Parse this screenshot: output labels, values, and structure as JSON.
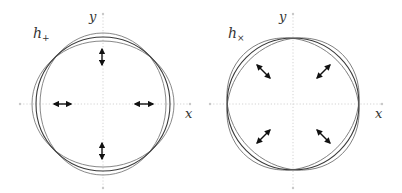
{
  "panels": [
    {
      "id": "plus",
      "polarization_label": "h",
      "polarization_subscript": "+",
      "x_axis_label": "x",
      "y_axis_label": "y",
      "deformation": "plus",
      "arrow_directions": [
        "vertical-top",
        "horizontal-left",
        "horizontal-right",
        "vertical-bottom"
      ]
    },
    {
      "id": "cross",
      "polarization_label": "h",
      "polarization_subscript": "×",
      "x_axis_label": "x",
      "y_axis_label": "y",
      "deformation": "cross",
      "arrow_directions": [
        "diagonal-top-left",
        "diagonal-top-right",
        "diagonal-bottom-left",
        "diagonal-bottom-right"
      ]
    }
  ],
  "colors": {
    "axis": "#c8c8c8",
    "ring_outer": "#7a7a7a",
    "ring_mid": "#3a3a3a",
    "arrow": "#111111",
    "text": "#333333"
  }
}
